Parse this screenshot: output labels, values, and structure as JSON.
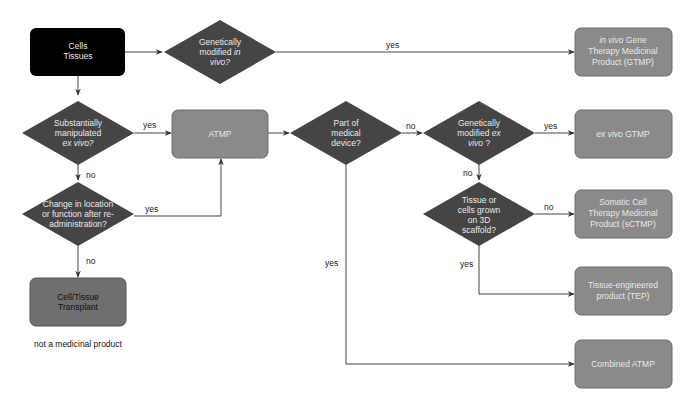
{
  "colors": {
    "start_fill": "#000000",
    "decision_fill": "#454545",
    "outcome_fill": "#8a8a8a",
    "outcome_stroke": "#6e6e6e",
    "transplant_fill": "#6f6f6f",
    "edge": "#444444"
  },
  "nodes": {
    "start": {
      "lines": [
        "Cells",
        "Tissues"
      ]
    },
    "q_in_vivo": {
      "lines": [
        "Genetically",
        "modified ",
        "in",
        "vivo?"
      ]
    },
    "gtmp": {
      "lines": [
        "in vivo",
        " Gene",
        "Therapy Medicinal",
        "Product (GTMP)"
      ]
    },
    "q_manipulated": {
      "lines": [
        "Substantially",
        "manipulated",
        "ex vivo?"
      ]
    },
    "atmp": {
      "lines": [
        "ATMP"
      ]
    },
    "q_device": {
      "lines": [
        "Part of",
        "medical",
        "device?"
      ]
    },
    "q_ex_vivo": {
      "lines": [
        "Genetically",
        "modified ",
        "ex",
        "vivo",
        " ?"
      ]
    },
    "ex_vivo_gtmp": {
      "lines": [
        "ex vivo",
        " GTMP"
      ]
    },
    "q_location": {
      "lines": [
        "Change in location",
        "or function after re-",
        "administration?"
      ]
    },
    "q_scaffold": {
      "lines": [
        "Tissue or",
        "cells grown",
        "on 3D",
        "scaffold?"
      ]
    },
    "sctmp": {
      "lines": [
        "Somatic Cell",
        "Therapy Medicinal",
        "Product (sCTMP)"
      ]
    },
    "transplant": {
      "lines": [
        "Cell/Tissue",
        "Transplant"
      ]
    },
    "tep": {
      "lines": [
        "Tissue-engineered",
        "product (TEP)"
      ]
    },
    "combined": {
      "lines": [
        "Combined ATMP"
      ]
    }
  },
  "edge_labels": {
    "in_vivo_yes": "yes",
    "manipulated_yes": "yes",
    "manipulated_no": "no",
    "location_yes": "yes",
    "location_no": "no",
    "device_no": "no",
    "device_yes": "yes",
    "ex_vivo_yes": "yes",
    "ex_vivo_no": "no",
    "scaffold_no": "no",
    "scaffold_yes": "yes"
  },
  "notes": {
    "transplant_note": "not a medicinal product"
  }
}
